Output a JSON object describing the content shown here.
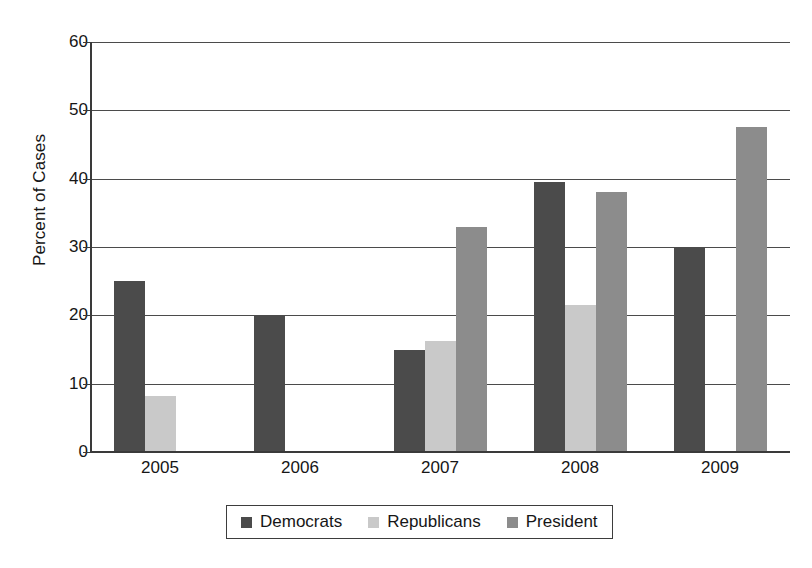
{
  "chart_data": {
    "type": "bar",
    "title": "",
    "subtitle": "",
    "xlabel": "",
    "ylabel": "Percent of Cases",
    "ylim": [
      0,
      60
    ],
    "ytick_step": 10,
    "yticks": [
      "0",
      "10",
      "20",
      "30",
      "40",
      "50",
      "60"
    ],
    "grid": "horizontal",
    "legend_position": "bottom",
    "categories": [
      "2005",
      "2006",
      "2007",
      "2008",
      "2009"
    ],
    "series": [
      {
        "name": "Democrats",
        "color": "#4b4b4b",
        "values": [
          25,
          20,
          15,
          39.5,
          29.8
        ]
      },
      {
        "name": "Republicans",
        "color": "#c9c9c9",
        "values": [
          8.2,
          null,
          16.2,
          21.5,
          null
        ]
      },
      {
        "name": "President",
        "color": "#8c8c8c",
        "values": [
          null,
          null,
          33,
          38,
          47.5
        ]
      }
    ]
  },
  "legend": {
    "items": [
      {
        "label": "Democrats",
        "series": "democrats"
      },
      {
        "label": "Republicans",
        "series": "republicans"
      },
      {
        "label": "President",
        "series": "president"
      }
    ]
  },
  "colors": {
    "democrats": "#4b4b4b",
    "republicans": "#c9c9c9",
    "president": "#8c8c8c",
    "axis": "#3a3a3a",
    "gridline": "#4b4b4b",
    "text": "#161616",
    "background": "#ffffff"
  }
}
